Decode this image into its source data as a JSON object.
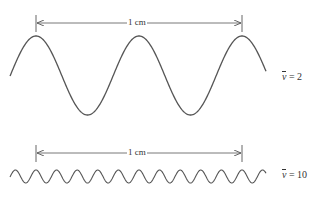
{
  "diagram": {
    "title": "",
    "scale_label": "1 cm",
    "colors": {
      "stroke": "#555555",
      "text": "#333333",
      "background": "#ffffff"
    },
    "panels": [
      {
        "id": "low-wavenumber",
        "scale_bar": {
          "label": "1 cm",
          "x1": 36,
          "x2": 242,
          "y": 23
        },
        "wave": {
          "x_start": 10,
          "x_end": 266,
          "center_y": 75.5,
          "amplitude": 39.5,
          "period_px": 103,
          "phase_peak_x": 36,
          "cycles_per_cm": 2
        },
        "label": {
          "symbol": "ν",
          "equals": "= 2"
        }
      },
      {
        "id": "high-wavenumber",
        "scale_bar": {
          "label": "1 cm",
          "x1": 36,
          "x2": 242,
          "y": 153
        },
        "wave": {
          "x_start": 10,
          "x_end": 266,
          "center_y": 176.5,
          "amplitude": 6.5,
          "period_px": 20.6,
          "phase_peak_x": 36,
          "cycles_per_cm": 10
        },
        "label": {
          "symbol": "ν",
          "equals": "= 10"
        }
      }
    ]
  }
}
